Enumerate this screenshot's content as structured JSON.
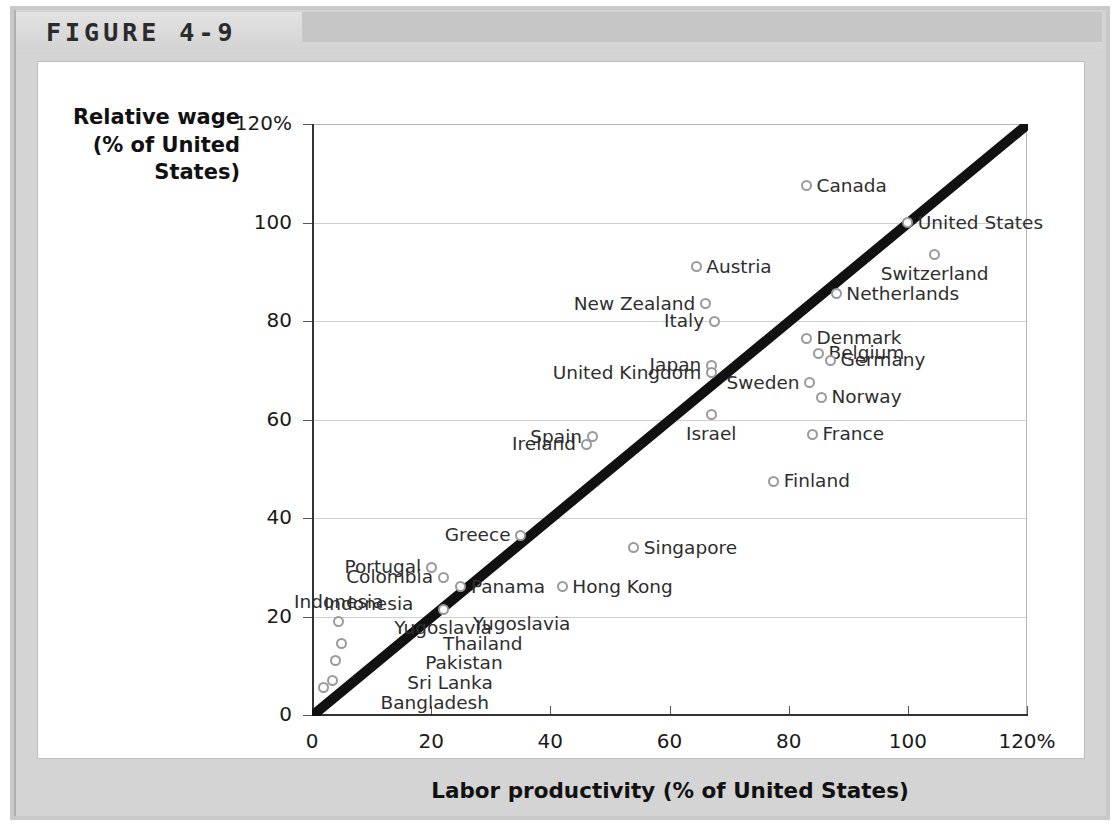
{
  "figure": {
    "label": "FIGURE 4-9"
  },
  "chart_data": {
    "type": "scatter",
    "title": "FIGURE 4-9",
    "xlabel": "Labor productivity (% of United States)",
    "ylabel": "Relative wage (% of United States)",
    "ylabel_lines": [
      "Relative wage",
      "(% of United",
      "States)"
    ],
    "xlim": [
      0,
      120
    ],
    "ylim": [
      0,
      120
    ],
    "xticks": [
      "0",
      "20",
      "40",
      "60",
      "80",
      "100",
      "120%"
    ],
    "xtick_values": [
      0,
      20,
      40,
      60,
      80,
      100,
      120
    ],
    "yticks": [
      "0",
      "20",
      "40",
      "60",
      "80",
      "100",
      "120%"
    ],
    "ytick_values": [
      0,
      20,
      40,
      60,
      80,
      100,
      120
    ],
    "grid": true,
    "legend": "none",
    "reference_line": {
      "description": "45-degree line",
      "from": [
        0,
        0
      ],
      "to": [
        120,
        120
      ]
    },
    "points": [
      {
        "name": "Canada",
        "x": 83.0,
        "y": 107.5,
        "label_side": "l"
      },
      {
        "name": "United States",
        "x": 100.0,
        "y": 100.0,
        "label_side": "l"
      },
      {
        "name": "Switzerland",
        "x": 104.5,
        "y": 93.5,
        "label_side": "below"
      },
      {
        "name": "Austria",
        "x": 64.5,
        "y": 91.0,
        "label_side": "l"
      },
      {
        "name": "Netherlands",
        "x": 88.0,
        "y": 85.5,
        "label_side": "l"
      },
      {
        "name": "New Zealand",
        "x": 66.0,
        "y": 83.5,
        "label_side": "r"
      },
      {
        "name": "Italy",
        "x": 67.5,
        "y": 80.0,
        "label_side": "r"
      },
      {
        "name": "Denmark",
        "x": 83.0,
        "y": 76.5,
        "label_side": "l"
      },
      {
        "name": "Belgium",
        "x": 85.0,
        "y": 73.5,
        "label_side": "l"
      },
      {
        "name": "Germany",
        "x": 87.0,
        "y": 72.0,
        "label_side": "l"
      },
      {
        "name": "Japan",
        "x": 67.0,
        "y": 71.0,
        "label_side": "r"
      },
      {
        "name": "United Kingdom",
        "x": 67.0,
        "y": 69.5,
        "label_side": "r"
      },
      {
        "name": "Sweden",
        "x": 83.5,
        "y": 67.5,
        "label_side": "r"
      },
      {
        "name": "Norway",
        "x": 85.5,
        "y": 64.5,
        "label_side": "l"
      },
      {
        "name": "Israel",
        "x": 67.0,
        "y": 61.0,
        "label_side": "below"
      },
      {
        "name": "France",
        "x": 84.0,
        "y": 57.0,
        "label_side": "l"
      },
      {
        "name": "Spain",
        "x": 47.0,
        "y": 56.5,
        "label_side": "r"
      },
      {
        "name": "Ireland",
        "x": 46.0,
        "y": 55.0,
        "label_side": "r"
      },
      {
        "name": "Finland",
        "x": 77.5,
        "y": 47.5,
        "label_side": "l"
      },
      {
        "name": "Greece",
        "x": 35.0,
        "y": 36.5,
        "label_side": "r"
      },
      {
        "name": "Singapore",
        "x": 54.0,
        "y": 34.0,
        "label_side": "l"
      },
      {
        "name": "Portugal",
        "x": 20.0,
        "y": 30.0,
        "label_side": "r"
      },
      {
        "name": "Colombia",
        "x": 22.0,
        "y": 28.0,
        "label_side": "r"
      },
      {
        "name": "Panama",
        "x": 25.0,
        "y": 26.0,
        "label_side": "l"
      },
      {
        "name": "Hong Kong",
        "x": 42.0,
        "y": 26.0,
        "label_side": "l"
      },
      {
        "name": "Yugoslavia",
        "x": 22.0,
        "y": 21.5,
        "label_side": "below"
      },
      {
        "name": "Indonesia",
        "x": 4.5,
        "y": 19.0,
        "label_side": "above"
      },
      {
        "name": "Thailand",
        "x": 5.0,
        "y": 14.5,
        "label_side": "far-right"
      },
      {
        "name": "Pakistan",
        "x": 4.0,
        "y": 11.0,
        "label_side": "far-right"
      },
      {
        "name": "Sri Lanka",
        "x": 3.5,
        "y": 7.0,
        "label_side": "far-right"
      },
      {
        "name": "Bangladesh",
        "x": 2.0,
        "y": 5.5,
        "label_side": "far-right"
      }
    ],
    "floating_labels": [
      {
        "text": "Indonesia",
        "x": 2.0,
        "y": 22.5,
        "align": "r-edge"
      },
      {
        "text": "Yugoslavia",
        "x": 27.0,
        "y": 18.5,
        "align": "l"
      },
      {
        "text": "Thailand",
        "x": 22.0,
        "y": 14.5,
        "align": "l"
      },
      {
        "text": "Pakistan",
        "x": 19.0,
        "y": 10.5,
        "align": "l"
      },
      {
        "text": "Sri Lanka",
        "x": 16.0,
        "y": 6.5,
        "align": "l"
      },
      {
        "text": "Bangladesh",
        "x": 11.5,
        "y": 2.5,
        "align": "l"
      }
    ]
  }
}
